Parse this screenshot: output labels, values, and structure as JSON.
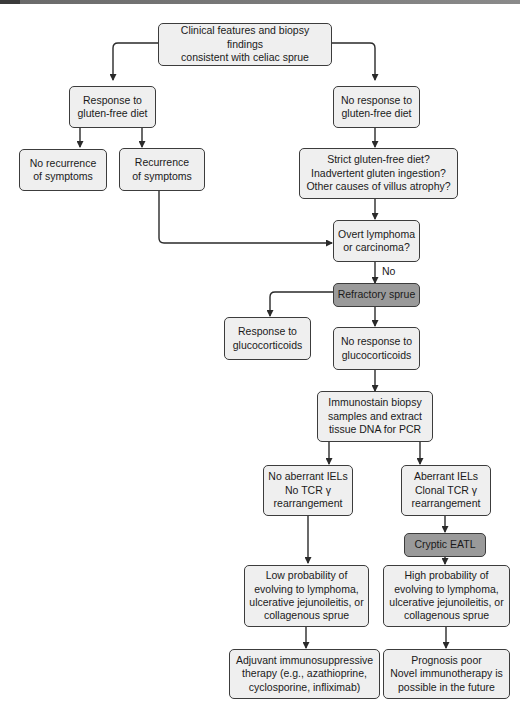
{
  "diagram": {
    "type": "flowchart",
    "colors": {
      "node_fill": "#efefef",
      "highlight_fill": "#9a9a9a",
      "border": "#3c3c3c",
      "arrow": "#2a2a2a"
    },
    "nodes": {
      "start": "Clinical features and biopsy findings\nconsistent with celiac sprue",
      "response_gfd": "Response to\ngluten-free diet",
      "no_response_gfd": "No response to\ngluten-free diet",
      "no_recurrence": "No recurrence\nof symptoms",
      "recurrence": "Recurrence\nof symptoms",
      "check_causes": "Strict gluten-free diet?\nInadvertent gluten ingestion?\nOther causes of villus atrophy?",
      "overt_lymphoma": "Overt lymphoma\nor carcinoma?",
      "refractory_sprue": "Refractory sprue",
      "response_gc": "Response to\nglucocorticoids",
      "no_response_gc": "No response to\nglucocorticoids",
      "immunostain": "Immunostain biopsy\nsamples and extract\ntissue DNA for PCR",
      "no_aberrant": "No aberrant IELs\nNo TCR γ\nrearrangement",
      "aberrant": "Aberrant IELs\nClonal TCR γ\nrearrangement",
      "cryptic_eatl": "Cryptic EATL",
      "low_prob": "Low probability of\nevolving to lymphoma,\nulcerative jejunoileitis, or\ncollagenous sprue",
      "high_prob": "High probability of\nevolving to lymphoma,\nulcerative jejunoileitis, or\ncollagenous sprue",
      "adjuvant": "Adjuvant immunosuppressive\ntherapy (e.g., azathioprine,\ncyclosporine, infliximab)",
      "prognosis": "Prognosis poor\nNovel immunotherapy is\npossible in the future"
    },
    "edge_labels": {
      "no": "No"
    },
    "edges": [
      [
        "start",
        "response_gfd"
      ],
      [
        "start",
        "no_response_gfd"
      ],
      [
        "response_gfd",
        "no_recurrence"
      ],
      [
        "response_gfd",
        "recurrence"
      ],
      [
        "no_response_gfd",
        "check_causes"
      ],
      [
        "recurrence",
        "overt_lymphoma"
      ],
      [
        "check_causes",
        "overt_lymphoma"
      ],
      [
        "overt_lymphoma",
        "refractory_sprue",
        "No"
      ],
      [
        "refractory_sprue",
        "response_gc"
      ],
      [
        "refractory_sprue",
        "no_response_gc"
      ],
      [
        "no_response_gc",
        "immunostain"
      ],
      [
        "immunostain",
        "no_aberrant"
      ],
      [
        "immunostain",
        "aberrant"
      ],
      [
        "aberrant",
        "cryptic_eatl"
      ],
      [
        "no_aberrant",
        "low_prob"
      ],
      [
        "cryptic_eatl",
        "high_prob"
      ],
      [
        "low_prob",
        "adjuvant"
      ],
      [
        "high_prob",
        "prognosis"
      ]
    ]
  }
}
